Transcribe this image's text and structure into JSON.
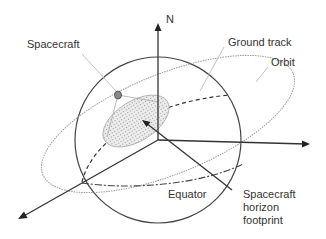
{
  "diagram": {
    "labels": {
      "north": "N",
      "spacecraft": "Spacecraft",
      "ground_track": "Ground track",
      "orbit": "Orbit",
      "equator": "Equator",
      "footprint_line1": "Spacecraft",
      "footprint_line2": "horizon",
      "footprint_line3": "footprint"
    },
    "colors": {
      "axis": "#333333",
      "sphere": "#444444",
      "orbit": "#999999",
      "footprint_fill": "#d9d9d9",
      "spacecraft": "#888888",
      "text": "#333333"
    }
  }
}
